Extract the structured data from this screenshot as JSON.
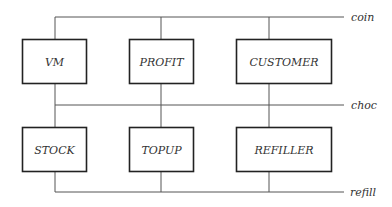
{
  "diagram": {
    "type": "process-channel-diagram",
    "colors": {
      "line": "#555555",
      "box_border": "#222222",
      "text": "#333333",
      "background": "#ffffff"
    },
    "channels": [
      {
        "id": "coin",
        "label": "coin",
        "y": 17
      },
      {
        "id": "choc",
        "label": "choc",
        "y": 105
      },
      {
        "id": "refill",
        "label": "refill",
        "y": 192
      }
    ],
    "processes": [
      {
        "id": "vm",
        "label": "VM",
        "row": 0,
        "col": 0
      },
      {
        "id": "profit",
        "label": "PROFIT",
        "row": 0,
        "col": 1
      },
      {
        "id": "customer",
        "label": "CUSTOMER",
        "row": 0,
        "col": 2
      },
      {
        "id": "stock",
        "label": "STOCK",
        "row": 1,
        "col": 0
      },
      {
        "id": "topup",
        "label": "TOPUP",
        "row": 1,
        "col": 1
      },
      {
        "id": "refiller",
        "label": "REFILLER",
        "row": 1,
        "col": 2
      }
    ],
    "connections": [
      {
        "from": "vm",
        "to": [
          "coin",
          "choc"
        ]
      },
      {
        "from": "profit",
        "to": [
          "coin",
          "choc"
        ]
      },
      {
        "from": "customer",
        "to": [
          "coin",
          "choc"
        ]
      },
      {
        "from": "stock",
        "to": [
          "choc",
          "refill"
        ]
      },
      {
        "from": "topup",
        "to": [
          "choc",
          "refill"
        ]
      },
      {
        "from": "refiller",
        "to": [
          "choc",
          "refill"
        ]
      }
    ]
  }
}
